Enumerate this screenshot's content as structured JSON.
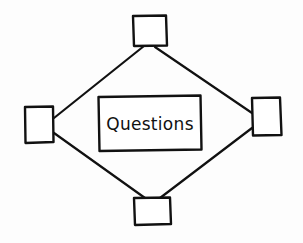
{
  "diagram": {
    "center": {
      "label": "Questions"
    },
    "nodes": [
      {
        "id": "top",
        "label": ""
      },
      {
        "id": "left",
        "label": ""
      },
      {
        "id": "right",
        "label": ""
      },
      {
        "id": "bottom",
        "label": ""
      }
    ],
    "edges": [
      {
        "from": "top",
        "to": "left"
      },
      {
        "from": "top",
        "to": "right"
      },
      {
        "from": "left",
        "to": "bottom"
      },
      {
        "from": "right",
        "to": "bottom"
      }
    ],
    "colors": {
      "stroke": "#111111",
      "background": "#ffffff"
    }
  }
}
